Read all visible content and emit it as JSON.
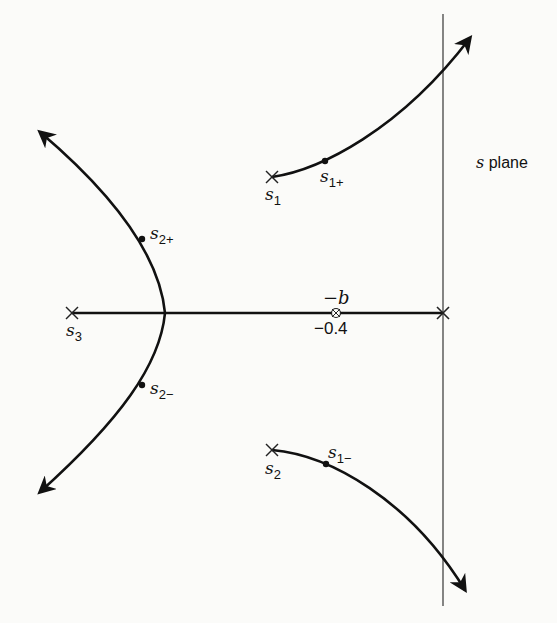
{
  "diagram": {
    "title": "s plane",
    "plane_label_var": "s",
    "plane_label_word": "plane",
    "colors": {
      "ink": "#111111",
      "axis": "#444444",
      "background": "#fbfbf9"
    },
    "axes": {
      "real_axis": {
        "from_label": "s3",
        "to": "origin"
      },
      "imaginary_axis": {
        "x_position": "origin"
      }
    },
    "poles": [
      {
        "id": "s1",
        "base": "s",
        "sub": "1"
      },
      {
        "id": "s2",
        "base": "s",
        "sub": "2"
      },
      {
        "id": "s3",
        "base": "s",
        "sub": "3"
      },
      {
        "id": "origin",
        "base": "",
        "sub": ""
      }
    ],
    "zero": {
      "label_top": "−b",
      "label_bottom": "−0.4"
    },
    "points": [
      {
        "id": "s1p",
        "base": "s",
        "sub": "1+"
      },
      {
        "id": "s1m",
        "base": "s",
        "sub": "1−"
      },
      {
        "id": "s2p",
        "base": "s",
        "sub": "2+"
      },
      {
        "id": "s2m",
        "base": "s",
        "sub": "2−"
      }
    ],
    "branches": [
      {
        "name": "branch-from-s1",
        "direction": "up-right, crosses imaginary axis"
      },
      {
        "name": "branch-from-s2",
        "direction": "down-right, crosses imaginary axis"
      },
      {
        "name": "branch-upper-left",
        "direction": "up-left asymptote"
      },
      {
        "name": "branch-lower-left",
        "direction": "down-left asymptote"
      }
    ]
  }
}
